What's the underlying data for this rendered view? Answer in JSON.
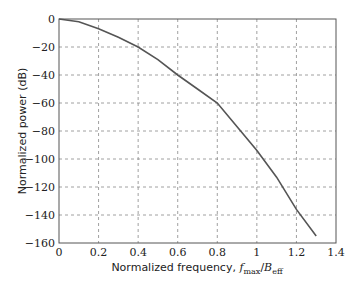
{
  "chart_data": {
    "type": "line",
    "title": "",
    "xlabel": "Normalized frequency, f_max/B_eff",
    "xlabel_parts": {
      "prefix": "Normalized frequency, ",
      "f": "f",
      "f_sub": "max",
      "slash": "/",
      "B": "B",
      "B_sub": "eff"
    },
    "ylabel": "Normalized power (dB)",
    "xlim": [
      0,
      1.4
    ],
    "ylim": [
      -160,
      0
    ],
    "xticks": [
      0,
      0.2,
      0.4,
      0.6,
      0.8,
      1,
      1.2,
      1.4
    ],
    "xtick_labels": [
      "0",
      "0.2",
      "0.4",
      "0.6",
      "0.8",
      "1",
      "1.2",
      "1.4"
    ],
    "yticks": [
      0,
      -20,
      -40,
      -60,
      -80,
      -100,
      -120,
      -140,
      -160
    ],
    "ytick_labels": [
      "0",
      "−20",
      "−40",
      "−60",
      "−80",
      "−100",
      "−120",
      "−140",
      "−160"
    ],
    "grid": true,
    "legend": null,
    "series": [
      {
        "name": "Normalized power",
        "color": "#555555",
        "x": [
          0,
          0.1,
          0.2,
          0.3,
          0.4,
          0.5,
          0.6,
          0.7,
          0.8,
          0.9,
          1.0,
          1.1,
          1.2,
          1.3
        ],
        "y": [
          0,
          -2,
          -7,
          -13,
          -20,
          -29,
          -40,
          -50,
          -60,
          -77,
          -94,
          -113,
          -136,
          -155
        ]
      }
    ]
  }
}
